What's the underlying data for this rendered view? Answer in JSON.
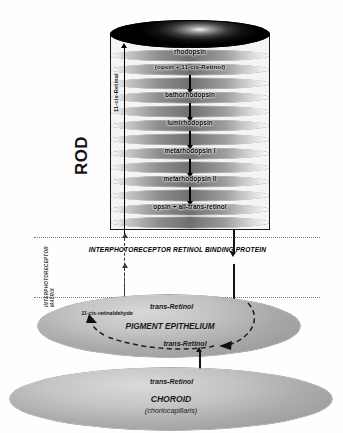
{
  "diagram": {
    "rod": {
      "side_label": "ROD",
      "recycle_label": "11-cis-Retinal",
      "cascade": [
        "rhodopsin",
        "(opsin + 11-cis-Retinol)",
        "bathorhodopsin",
        "lumirhodopsin",
        "metarhodopsin I",
        "metarhodopsin II",
        "opsin + all-trans-retinol"
      ]
    },
    "matrix": {
      "band_label": "INTERPHOTORECEPTOR RETINOL BINDING PROTEIN",
      "side_label_line1": "INTERPHOTORECEPTOR",
      "side_label_line2": "MATRIX"
    },
    "pigment_epithelium": {
      "name": "PIGMENT EPITHELIUM",
      "top_metabolite": "trans-Retinol",
      "loop_metabolite": "trans-Retinol",
      "product": "11-cis-retinaldehyde"
    },
    "choroid": {
      "metabolite": "trans-Retinol",
      "name": "CHOROID",
      "subtitle": "(choriocapillaris)"
    },
    "colors": {
      "ink": "#111111",
      "disc_gray": "#8e8e8e",
      "tissue_gray": "#c2c2c2",
      "dotted_line": "#7a7a7a"
    }
  }
}
